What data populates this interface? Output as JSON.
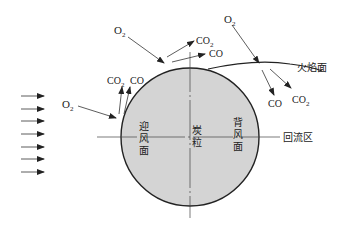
{
  "diagram": {
    "labels": {
      "flame_surface": "火焰面",
      "recirculation_zone": "回流区",
      "windward_1": "迎",
      "windward_2": "风",
      "windward_3": "面",
      "particle_1": "炭",
      "particle_2": "粒",
      "leeward_1": "背",
      "leeward_2": "风",
      "leeward_3": "面"
    },
    "species": {
      "o2_left": "O",
      "o2_left_sub": "2",
      "co2_left": "CO",
      "co2_left_sub": "2",
      "co_left": "CO",
      "o2_top": "O",
      "o2_top_sub": "2",
      "co2_top": "CO",
      "co2_top_sub": "2",
      "co_top": "CO",
      "o2_right": "O",
      "o2_right_sub": "2",
      "co_right": "CO",
      "co2_right": "CO",
      "co2_right_sub": "2"
    },
    "colors": {
      "particle_fill": "#d4d4d4",
      "stroke": "#222222"
    },
    "flow_arrows_count": 7
  }
}
